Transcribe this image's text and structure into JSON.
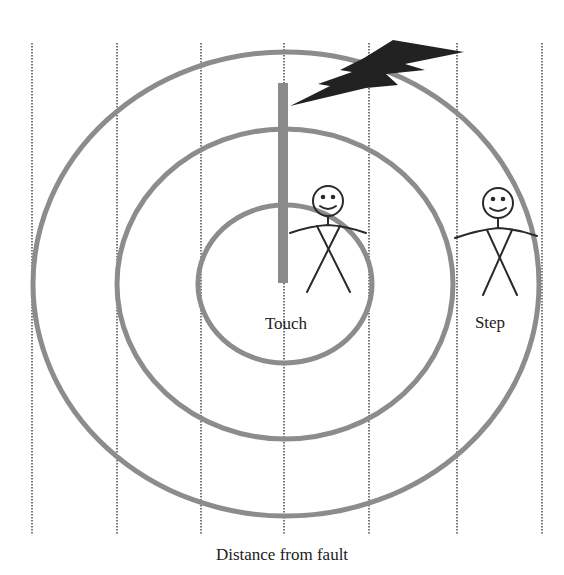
{
  "diagram": {
    "caption": "Distance from fault",
    "labels": {
      "touch": "Touch",
      "step": "Step"
    },
    "colors": {
      "ring": "#8c8c8c",
      "pole": "#8a8a8a",
      "lightning": "#222222",
      "figure": "#2a2a2a",
      "grid": "#777777"
    },
    "elements": {
      "grid_lines_count": 7,
      "rings": [
        "inner-zone",
        "middle-zone",
        "outer-zone"
      ],
      "pole": "utility-pole",
      "lightning": "lightning-bolt",
      "figures": [
        "touch-person",
        "step-person"
      ]
    }
  }
}
